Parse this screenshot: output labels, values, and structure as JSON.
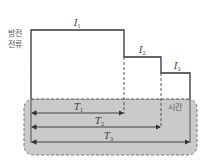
{
  "diagram": {
    "y_axis_label_line1": "방전",
    "y_axis_label_line2": "전류",
    "x_axis_label": "시간",
    "currents": [
      {
        "symbol": "I",
        "subscript": "1"
      },
      {
        "symbol": "I",
        "subscript": "2"
      },
      {
        "symbol": "I",
        "subscript": "3"
      }
    ],
    "durations": [
      {
        "symbol": "T",
        "subscript": "1"
      },
      {
        "symbol": "T",
        "subscript": "2"
      },
      {
        "symbol": "T",
        "subscript": "3"
      }
    ],
    "colors": {
      "outline": "#333333",
      "shade": "#c8c8c8",
      "dash": "#666666"
    }
  }
}
